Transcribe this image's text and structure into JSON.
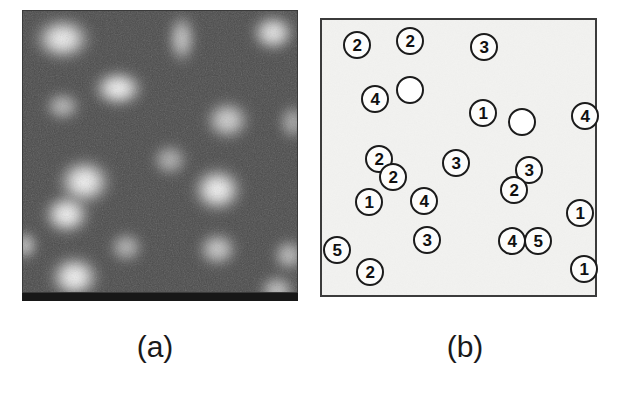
{
  "figure": {
    "panels": [
      {
        "id": "a",
        "caption": "(a)",
        "kind": "grayscale-micrograph",
        "description": "Noisy grayscale scanning-probe micrograph showing bright rounded protrusions on a dark background",
        "background_color": "#4a4a4a",
        "bottom_bar_color": "#171717",
        "bright_spots": [
          {
            "cx": 40,
            "cy": 28,
            "rx": 34,
            "ry": 26,
            "intensity": 0.97
          },
          {
            "cx": 96,
            "cy": 78,
            "rx": 30,
            "ry": 22,
            "intensity": 1.0
          },
          {
            "cx": 40,
            "cy": 96,
            "rx": 22,
            "ry": 18,
            "intensity": 0.62
          },
          {
            "cx": 160,
            "cy": 28,
            "rx": 17,
            "ry": 30,
            "intensity": 0.7
          },
          {
            "cx": 252,
            "cy": 22,
            "rx": 26,
            "ry": 22,
            "intensity": 0.92
          },
          {
            "cx": 206,
            "cy": 110,
            "rx": 27,
            "ry": 24,
            "intensity": 0.78
          },
          {
            "cx": 148,
            "cy": 150,
            "rx": 22,
            "ry": 20,
            "intensity": 0.58
          },
          {
            "cx": 62,
            "cy": 172,
            "rx": 32,
            "ry": 28,
            "intensity": 1.0
          },
          {
            "cx": 44,
            "cy": 205,
            "rx": 28,
            "ry": 24,
            "intensity": 1.0
          },
          {
            "cx": 196,
            "cy": 180,
            "rx": 30,
            "ry": 27,
            "intensity": 1.0
          },
          {
            "cx": 104,
            "cy": 238,
            "rx": 21,
            "ry": 19,
            "intensity": 0.6
          },
          {
            "cx": 196,
            "cy": 240,
            "rx": 24,
            "ry": 21,
            "intensity": 0.74
          },
          {
            "cx": 268,
            "cy": 246,
            "rx": 20,
            "ry": 20,
            "intensity": 0.66
          },
          {
            "cx": 2,
            "cy": 236,
            "rx": 16,
            "ry": 18,
            "intensity": 0.7
          },
          {
            "cx": 52,
            "cy": 268,
            "rx": 30,
            "ry": 26,
            "intensity": 1.0
          },
          {
            "cx": 272,
            "cy": 112,
            "rx": 18,
            "ry": 22,
            "intensity": 0.55
          },
          {
            "cx": 256,
            "cy": 282,
            "rx": 22,
            "ry": 20,
            "intensity": 0.7
          }
        ]
      },
      {
        "id": "b",
        "caption": "(b)",
        "kind": "schematic-map",
        "description": "Schematic map of the same area with each protrusion outlined as a circle labelled by its assigned cluster size",
        "background_color": "#f2f2f0",
        "border_color": "#3b3b3b",
        "circles": [
          {
            "label": "2",
            "cx": 35,
            "cy": 25,
            "r": 14
          },
          {
            "label": "2",
            "cx": 88,
            "cy": 21,
            "r": 14
          },
          {
            "label": "3",
            "cx": 162,
            "cy": 27,
            "r": 14
          },
          {
            "label": "4",
            "cx": 53,
            "cy": 79,
            "r": 14
          },
          {
            "label": "",
            "cx": 88,
            "cy": 70,
            "r": 14
          },
          {
            "label": "1",
            "cx": 161,
            "cy": 93,
            "r": 14
          },
          {
            "label": "",
            "cx": 200,
            "cy": 102,
            "r": 14
          },
          {
            "label": "4",
            "cx": 263,
            "cy": 96,
            "r": 14
          },
          {
            "label": "2",
            "cx": 57,
            "cy": 139,
            "r": 14
          },
          {
            "label": "2",
            "cx": 71,
            "cy": 157,
            "r": 14
          },
          {
            "label": "3",
            "cx": 134,
            "cy": 143,
            "r": 14
          },
          {
            "label": "3",
            "cx": 207,
            "cy": 150,
            "r": 14
          },
          {
            "label": "2",
            "cx": 192,
            "cy": 170,
            "r": 14
          },
          {
            "label": "1",
            "cx": 47,
            "cy": 182,
            "r": 14
          },
          {
            "label": "4",
            "cx": 102,
            "cy": 181,
            "r": 14
          },
          {
            "label": "1",
            "cx": 258,
            "cy": 193,
            "r": 14
          },
          {
            "label": "3",
            "cx": 105,
            "cy": 220,
            "r": 14
          },
          {
            "label": "4",
            "cx": 190,
            "cy": 221,
            "r": 14
          },
          {
            "label": "5",
            "cx": 216,
            "cy": 221,
            "r": 14
          },
          {
            "label": "5",
            "cx": 15,
            "cy": 230,
            "r": 14
          },
          {
            "label": "2",
            "cx": 48,
            "cy": 252,
            "r": 14
          },
          {
            "label": "1",
            "cx": 262,
            "cy": 249,
            "r": 14
          }
        ]
      }
    ]
  }
}
